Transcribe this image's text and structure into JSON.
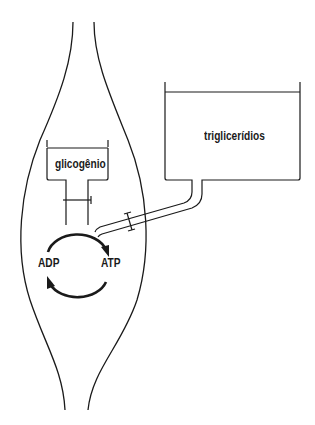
{
  "diagram": {
    "type": "energy-reservoir-diagram",
    "colors": {
      "stroke": "#1a1a1a",
      "background": "#ffffff"
    },
    "cell": {
      "shape": "fusiform-muscle-fiber"
    },
    "labels": {
      "glycogen": "glicogênio",
      "triglycerides": "triglicerídios",
      "adp": "ADP",
      "atp": "ATP"
    },
    "nodes": [
      {
        "id": "glycogen-reservoir",
        "label": "glicogênio",
        "location": "inside cell"
      },
      {
        "id": "triglyceride-reservoir",
        "label": "triglicerídios",
        "location": "outside cell"
      },
      {
        "id": "adp",
        "label": "ADP"
      },
      {
        "id": "atp",
        "label": "ATP"
      }
    ],
    "edges": [
      {
        "from": "glycogen-reservoir",
        "to": "adp-atp-cycle",
        "kind": "pipe-with-valve"
      },
      {
        "from": "triglyceride-reservoir",
        "to": "adp-atp-cycle",
        "kind": "pipe-with-valve"
      },
      {
        "from": "adp",
        "to": "atp",
        "kind": "cycle-arrow"
      },
      {
        "from": "atp",
        "to": "adp",
        "kind": "cycle-arrow"
      }
    ]
  }
}
